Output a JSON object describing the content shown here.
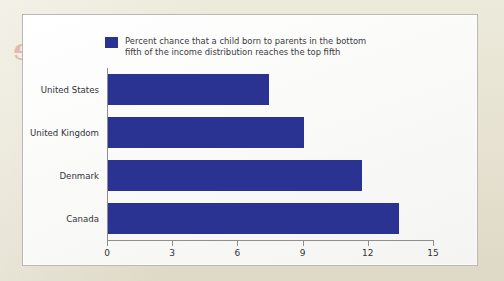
{
  "page": {
    "bleed_text_left": "Income",
    "bleed_text_right": "Income"
  },
  "chart_data": {
    "type": "bar",
    "orientation": "horizontal",
    "title": "",
    "xlabel": "",
    "ylabel": "",
    "categories": [
      "United States",
      "United Kingdom",
      "Denmark",
      "Canada"
    ],
    "values": [
      7.4,
      9.0,
      11.7,
      13.4
    ],
    "series": [
      {
        "name": "Percent chance that a child born to parents in the bottom fifth of the income distribution reaches the top fifth",
        "values": [
          7.4,
          9.0,
          11.7,
          13.4
        ]
      }
    ],
    "xlim": [
      0,
      15
    ],
    "xticks": [
      0,
      3,
      6,
      9,
      12,
      15
    ],
    "xtick_labels": [
      "0",
      "3",
      "6",
      "9",
      "12",
      "15"
    ],
    "grid": false,
    "legend_position": "top-left",
    "bar_color": "#2a3391",
    "legend": {
      "swatch_color": "#2a3391",
      "label": "Percent chance that a child born to parents in the bottom\nfifth of the income distribution reaches the top fifth"
    }
  }
}
